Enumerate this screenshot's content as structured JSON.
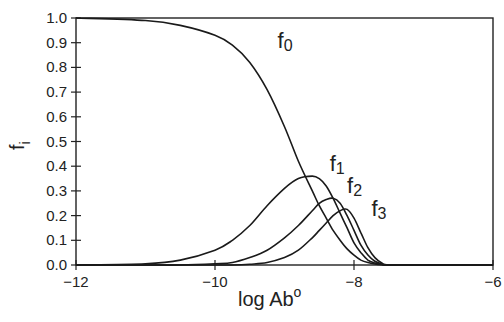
{
  "chart_data": {
    "type": "line",
    "title": "",
    "xlabel": "log Ab",
    "xlabel_superscript": "o",
    "ylabel": "f",
    "ylabel_subscript": "i",
    "xlim": [
      -12,
      -6
    ],
    "ylim": [
      0.0,
      1.0
    ],
    "grid": false,
    "legend": "inline curve labels",
    "x_ticks": [
      -12,
      -10,
      -8,
      -6
    ],
    "x_tick_labels": [
      "−12",
      "−10",
      "−8",
      "−6"
    ],
    "y_ticks": [
      0.0,
      0.1,
      0.2,
      0.3,
      0.4,
      0.5,
      0.6,
      0.7,
      0.8,
      0.9,
      1.0
    ],
    "y_tick_labels": [
      "0.0",
      "0.1",
      "0.2",
      "0.3",
      "0.4",
      "0.5",
      "0.6",
      "0.7",
      "0.8",
      "0.9",
      "1.0"
    ],
    "x": [
      -12.0,
      -11.0,
      -10.5,
      -10.0,
      -9.75,
      -9.5,
      -9.25,
      -9.0,
      -8.8,
      -8.6,
      -8.5,
      -8.4,
      -8.3,
      -8.2,
      -8.1,
      -8.0,
      -7.9,
      -7.8,
      -7.7,
      -7.6,
      -7.5,
      -7.0,
      -6.0
    ],
    "series": [
      {
        "name": "f0",
        "label": "f",
        "sub": "0",
        "values": [
          1.0,
          0.99,
          0.97,
          0.93,
          0.89,
          0.82,
          0.71,
          0.56,
          0.42,
          0.3,
          0.24,
          0.19,
          0.14,
          0.1,
          0.065,
          0.04,
          0.02,
          0.01,
          0.004,
          0.001,
          0.0,
          0.0,
          0.0
        ]
      },
      {
        "name": "f1",
        "label": "f",
        "sub": "1",
        "values": [
          0.0,
          0.005,
          0.02,
          0.06,
          0.1,
          0.16,
          0.24,
          0.31,
          0.35,
          0.36,
          0.35,
          0.32,
          0.27,
          0.21,
          0.15,
          0.09,
          0.05,
          0.02,
          0.008,
          0.002,
          0.0,
          0.0,
          0.0
        ]
      },
      {
        "name": "f2",
        "label": "f",
        "sub": "2",
        "values": [
          0.0,
          0.0,
          0.0,
          0.005,
          0.01,
          0.03,
          0.06,
          0.11,
          0.16,
          0.22,
          0.25,
          0.265,
          0.27,
          0.25,
          0.2,
          0.14,
          0.08,
          0.04,
          0.015,
          0.004,
          0.0,
          0.0,
          0.0
        ]
      },
      {
        "name": "f3",
        "label": "f",
        "sub": "3",
        "values": [
          0.0,
          0.0,
          0.0,
          0.0,
          0.0,
          0.003,
          0.01,
          0.03,
          0.06,
          0.11,
          0.14,
          0.17,
          0.2,
          0.22,
          0.225,
          0.19,
          0.13,
          0.07,
          0.03,
          0.008,
          0.0,
          0.0,
          0.0
        ]
      }
    ],
    "annotations": [
      {
        "text": "f0",
        "x": -9.1,
        "y": 0.88
      },
      {
        "text": "f1",
        "x": -8.35,
        "y": 0.38
      },
      {
        "text": "f2",
        "x": -8.1,
        "y": 0.29
      },
      {
        "text": "f3",
        "x": -7.75,
        "y": 0.2
      }
    ]
  },
  "colors": {
    "line": "#1a1a1a",
    "axis": "#222222",
    "background": "#ffffff"
  }
}
